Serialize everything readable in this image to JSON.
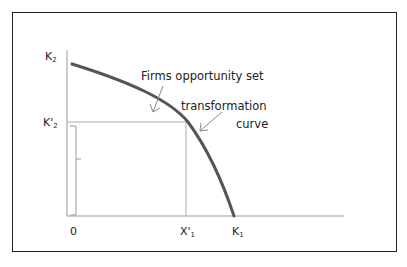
{
  "diagram": {
    "type": "production-possibility-frontier",
    "axes": {
      "origin_label": "0",
      "y_axis_label": {
        "base": "K",
        "sub": "2"
      },
      "x_axis_label": {
        "base": "K",
        "sub": "1"
      }
    },
    "points": {
      "y_marker": {
        "base": "K'",
        "sub": "2"
      },
      "x_marker": {
        "base": "X'",
        "sub": "1"
      }
    },
    "annotations": {
      "opportunity_set": "Firms opportunity set",
      "transformation_line1": "transformation",
      "transformation_line2": "curve"
    },
    "colors": {
      "curve": "#555555",
      "axes": "#999999",
      "guide_lines": "#aaaaaa",
      "arrows": "#888888",
      "frame": "#222222"
    }
  }
}
